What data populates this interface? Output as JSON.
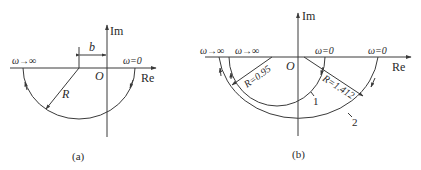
{
  "figure": {
    "type": "nyquist-plot-pair",
    "stroke_color": "#3a3a3a",
    "background": "#ffffff"
  },
  "panel_a": {
    "caption": "(a)",
    "axes": {
      "real_label": "Re",
      "imag_label": "Im",
      "origin_label": "O"
    },
    "labels": {
      "omega_inf": "ω→∞",
      "omega_zero": "ω=0",
      "offset": "b",
      "radius": "R"
    },
    "curve": {
      "shape": "semicircle",
      "direction": "ω=0 → ω→∞ clockwise through lower half-plane"
    }
  },
  "panel_b": {
    "caption": "(b)",
    "axes": {
      "real_label": "Re",
      "imag_label": "Im",
      "origin_label": "O"
    },
    "curves": [
      {
        "id": "1",
        "label": "1",
        "radius_label": "R=0.95",
        "omega_inf": "ω→∞",
        "omega_zero": "ω=0"
      },
      {
        "id": "2",
        "label": "2",
        "radius_label": "R=1.412",
        "omega_inf": "ω→∞",
        "omega_zero": "ω=0"
      }
    ]
  }
}
